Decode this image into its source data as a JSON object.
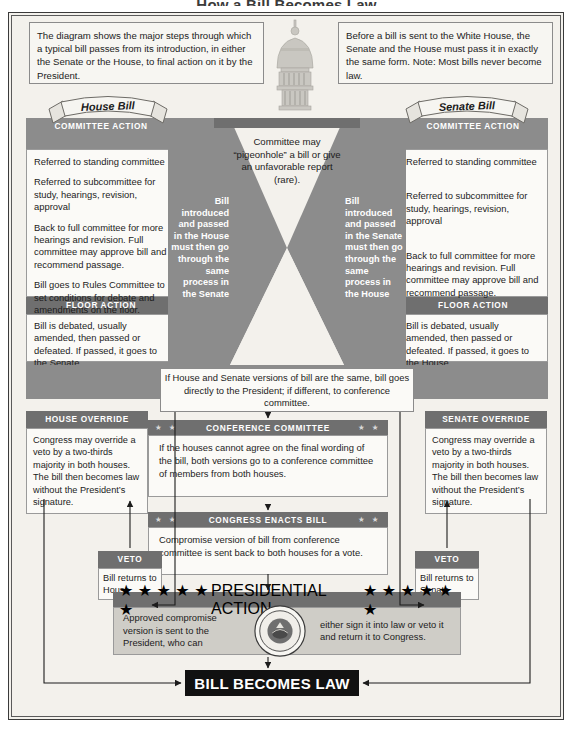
{
  "title": "How a Bill Becomes Law",
  "intro": {
    "left": "The diagram shows the major steps through which a typical bill passes from its introduction, in either the Senate or the House, to final action on it by the President.",
    "right": "Before a bill is sent to the White House, the Senate and the House must pass it in exactly the same form. Note: Most bills never become law."
  },
  "house": {
    "banner": "House Bill",
    "committee_header": "COMMITTEE ACTION",
    "committee_items": [
      "Referred to standing committee",
      "Referred to subcommittee for study, hearings, revision, approval",
      "Back to full committee for more hearings and revision. Full committee may approve bill and recommend passage.",
      "Bill goes to Rules Committee to set conditions for debate and amendments on the floor."
    ],
    "floor_header": "FLOOR ACTION",
    "floor_text": "Bill is debated, usually amended, then passed or defeated. If passed, it goes to the Senate."
  },
  "senate": {
    "banner": "Senate Bill",
    "committee_header": "COMMITTEE ACTION",
    "committee_items": [
      "Referred to standing committee",
      "Referred to subcommittee for study, hearings, revision, approval",
      "Back to full committee for more hearings and revision. Full committee may approve bill and recommend passage."
    ],
    "floor_header": "FLOOR ACTION",
    "floor_text": "Bill is debated, usually amended, then passed or defeated. If passed, it goes to the House."
  },
  "center": {
    "pigeonhole": "Committee may “pigeonhole” a bill or give an unfavorable report (rare).",
    "channel_left": "Bill introduced and passed in the House must then go through the same process in the Senate",
    "channel_right": "Bill introduced and passed in the Senate must then go through the same process in the House",
    "same_versions": "If House and Senate versions of bill are the same, bill goes directly to the President; if different, to conference committee."
  },
  "conference": {
    "header": "CONFERENCE COMMITTEE",
    "stars_left": "★ ★",
    "stars_right": "★ ★",
    "body": "If the houses cannot agree on the final wording of the bill, both versions go to a conference committee of members from both houses."
  },
  "enacts": {
    "header": "CONGRESS ENACTS BILL",
    "stars_left": "★ ★",
    "stars_right": "★ ★",
    "body": "Compromise version of bill from conference committee is sent back to both houses for a vote."
  },
  "house_override": {
    "header": "HOUSE OVERRIDE",
    "body": "Congress may override a veto by a two-thirds majority in both houses. The bill then becomes law without the President’s signature."
  },
  "senate_override": {
    "header": "SENATE OVERRIDE",
    "body": "Congress may override a veto by a two-thirds majority in both houses. The bill then becomes law without the President’s signature."
  },
  "veto_house": {
    "header": "VETO",
    "body": "Bill returns to House"
  },
  "veto_senate": {
    "header": "VETO",
    "body": "Bill returns to Senate"
  },
  "presidential": {
    "header": "PRESIDENTIAL ACTION",
    "stars_left": "★ ★ ★ ★ ★ ★",
    "stars_right": "★ ★ ★ ★ ★ ★",
    "left_text": "Approved compromise version is sent to the President, who can",
    "right_text": "either sign it into law or veto it and return it to Congress.",
    "seal_label": "presidential-seal"
  },
  "result": {
    "label": "BILL BECOMES LAW"
  },
  "colors": {
    "panel_gray": "#8c8c8c",
    "header_gray": "#6f6f6f",
    "paper": "#f3f1ec",
    "box_white": "#fbfaf7",
    "law_bar": "#111111",
    "pres_body": "#cfcdc7"
  }
}
